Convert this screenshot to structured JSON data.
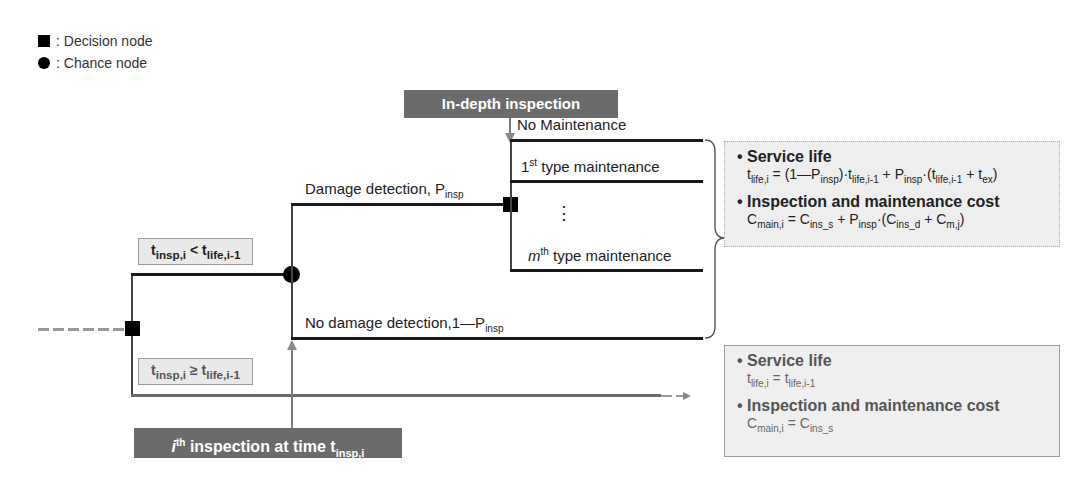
{
  "legend": {
    "decision": ": Decision node",
    "chance": ": Chance node"
  },
  "boxes": {
    "in_depth": "In-depth inspection",
    "ith_inspection_prefix": "i",
    "ith_inspection_sup": "th",
    "ith_inspection_text": " inspection at time t",
    "ith_inspection_sub": "insp,i"
  },
  "conditions": {
    "lt": {
      "t": "t",
      "sub1": "insp,i",
      "op": " < t",
      "sub2": "life,i-1"
    },
    "ge": {
      "t": "t",
      "sub1": "insp,i",
      "op": " ≥ t",
      "sub2": "life,i-1"
    }
  },
  "branches": {
    "damage_detection": "Damage detection, P",
    "damage_detection_sub": "insp",
    "no_damage_detection": "No damage detection,1—P",
    "no_damage_detection_sub": "insp",
    "no_maintenance": "No Maintenance",
    "first_type_num": "1",
    "first_type_sup": "st",
    "first_type_text": " type maintenance",
    "ellipsis": "⋮",
    "mth_type_m": "m",
    "mth_type_sup": "th",
    "mth_type_text": " type maintenance"
  },
  "result_detected": {
    "service_life_title": "• Service life",
    "service_life_formula": "t_life,i = (1—P_insp)·t_life,i-1 + P_insp·(t_life,i-1 + t_ex)",
    "cost_title": "• Inspection and maintenance cost",
    "cost_formula": "C_main,i = C_ins_s + P_insp·(C_ins_d + C_m,j)"
  },
  "result_not_inspected": {
    "service_life_title": "• Service life",
    "service_life_formula": "t_life,i = t_life,i-1",
    "cost_title": "• Inspection and maintenance cost",
    "cost_formula": "C_main,i = C_ins_s"
  }
}
